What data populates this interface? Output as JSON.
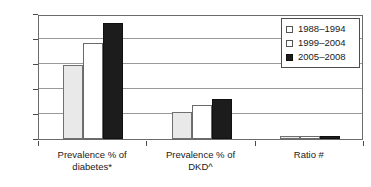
{
  "chart_data": {
    "type": "bar",
    "title": "",
    "subtitle": "",
    "xlabel": "",
    "ylabel": "",
    "ylim": [
      0.0,
      10.0
    ],
    "ytick_labels": [
      "0.0",
      "2.0",
      "4.0",
      "6.0",
      "8.0",
      "10.0"
    ],
    "ytick_values": [
      0.0,
      2.0,
      4.0,
      6.0,
      8.0,
      10.0
    ],
    "grid": true,
    "legend_position": "top-right",
    "categories": [
      "Prevalence % of diabetes*",
      "Prevalence % of DKD^",
      "Ratio #"
    ],
    "category_lines": [
      [
        "Prevalence % of",
        "diabetes*"
      ],
      [
        "Prevalence % of",
        "DKD^"
      ],
      [
        "Ratio #",
        ""
      ]
    ],
    "series": [
      {
        "name": "1988–1994",
        "color": "#e9e9e9",
        "values": [
          5.95,
          2.15,
          0.25
        ]
      },
      {
        "name": "1999–2004",
        "color": "#ffffff",
        "values": [
          7.65,
          2.7,
          0.25
        ]
      },
      {
        "name": "2005–2008",
        "color": "#1c1c1c",
        "values": [
          9.3,
          3.2,
          0.25
        ]
      }
    ]
  },
  "legend": {
    "entries": [
      {
        "label": "1988–1994"
      },
      {
        "label": "1999–2004"
      },
      {
        "label": "2005–2008"
      }
    ]
  },
  "axis": {
    "y_labels": [
      "10.0",
      "8.0",
      "6.0",
      "4.0",
      "2.0",
      "0.0"
    ]
  }
}
